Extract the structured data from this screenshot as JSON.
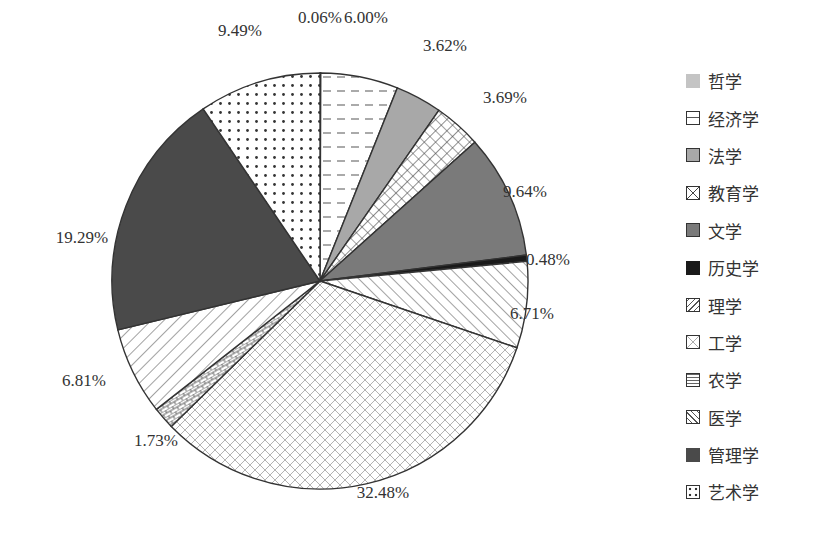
{
  "chart_data": {
    "type": "pie",
    "title": "",
    "categories": [
      "哲学",
      "经济学",
      "法学",
      "教育学",
      "文学",
      "历史学",
      "理学",
      "工学",
      "农学",
      "医学",
      "管理学",
      "艺术学"
    ],
    "values": [
      0.06,
      6.0,
      3.62,
      3.69,
      9.64,
      0.48,
      6.71,
      32.48,
      1.73,
      6.81,
      19.29,
      9.49
    ],
    "labels": [
      "0.06%",
      "6.00%",
      "3.62%",
      "3.69%",
      "9.64%",
      "0.48%",
      "6.71%",
      "32.48%",
      "1.73%",
      "6.81%",
      "19.29%",
      "9.49%"
    ],
    "unit": "%",
    "start_angle": "12 o'clock",
    "direction": "clockwise",
    "legend_position": "right",
    "fills": [
      "light-gray-solid",
      "horizontal-dashes",
      "gray-solid",
      "crosshatch-grid",
      "dark-gray-solid",
      "black-solid",
      "diagonal-hatch",
      "light-diamond-lattice",
      "brick-pattern",
      "back-diagonal-hatch",
      "darkest-gray-solid",
      "dots"
    ]
  },
  "legend": {
    "items": [
      {
        "label": "哲学"
      },
      {
        "label": "经济学"
      },
      {
        "label": "法学"
      },
      {
        "label": "教育学"
      },
      {
        "label": "文学"
      },
      {
        "label": "历史学"
      },
      {
        "label": "理学"
      },
      {
        "label": "工学"
      },
      {
        "label": "农学"
      },
      {
        "label": "医学"
      },
      {
        "label": "管理学"
      },
      {
        "label": "艺术学"
      }
    ]
  },
  "colors": {
    "philosophy": "#c4c4c4",
    "law": "#a8a8a8",
    "literature": "#7a7a7a",
    "history": "#1a1a1a",
    "management": "#5a5a5a",
    "outline": "#333333"
  }
}
